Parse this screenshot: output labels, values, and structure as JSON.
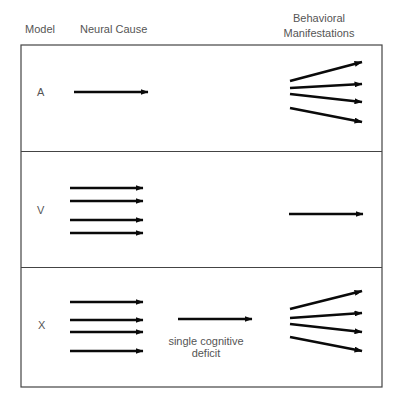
{
  "headers": {
    "model": "Model",
    "neural_cause": "Neural Cause",
    "behavioral_line1": "Behavioral",
    "behavioral_line2": "Manifestations"
  },
  "colors": {
    "arrow": "#0a0a0a",
    "border": "#444444",
    "text": "#555555",
    "background": "#ffffff"
  },
  "panels": [
    {
      "label": "A",
      "neural_arrow_count": 1,
      "behavioral_arrow_count": 4,
      "description": "single neural cause leads to multiple behavioral manifestations"
    },
    {
      "label": "V",
      "neural_arrow_count": 4,
      "behavioral_arrow_count": 1,
      "description": "multiple neural causes converge on a single behavioral manifestation"
    },
    {
      "label": "X",
      "neural_arrow_count": 4,
      "intermediate_label_line1": "single cognitive",
      "intermediate_label_line2": "deficit",
      "behavioral_arrow_count": 4,
      "description": "multiple neural causes converge on single cognitive deficit which leads to multiple behavioral manifestations"
    }
  ]
}
